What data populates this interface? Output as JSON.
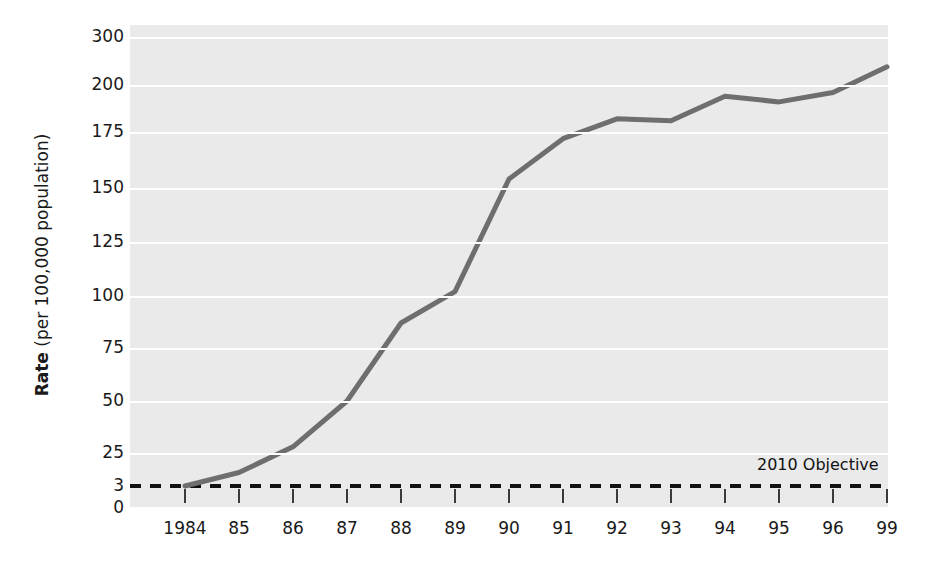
{
  "chart_data": {
    "type": "line",
    "title": "",
    "xlabel": "",
    "ylabel": "Rate (per 100,000 population)",
    "ylabel_bold_part": "Rate",
    "ylabel_rest": " (per 100,000 population)",
    "categories": [
      "1984",
      "85",
      "86",
      "87",
      "88",
      "89",
      "90",
      "91",
      "92",
      "93",
      "94",
      "95",
      "96",
      "99"
    ],
    "values": [
      3,
      12,
      28,
      50,
      87,
      102,
      154,
      172,
      182,
      181,
      194,
      191,
      196,
      238
    ],
    "series": [
      {
        "name": "Rate",
        "color": "#6e6e6e",
        "values": [
          3,
          12,
          28,
          50,
          87,
          102,
          154,
          172,
          182,
          181,
          194,
          191,
          196,
          238
        ]
      }
    ],
    "ytick_labels": [
      "0",
      "3",
      "25",
      "50",
      "75",
      "100",
      "125",
      "150",
      "175",
      "200",
      "300"
    ],
    "ytick_values": [
      0,
      3,
      25,
      50,
      75,
      100,
      125,
      150,
      175,
      200,
      300
    ],
    "yaxis_scale": "categorical-uneven",
    "ylim": [
      0,
      300
    ],
    "grid": true,
    "legend": "none",
    "annotations": [
      {
        "name": "objective-line",
        "label": "2010 Objective",
        "value": 3,
        "style": "dashed",
        "color": "#111111"
      }
    ],
    "plot_background": "#eaeaea",
    "gridline_color": "#ffffff"
  },
  "axis": {
    "y_label_bold": "Rate",
    "y_label_rest": " (per 100,000 population)"
  },
  "ticks": {
    "y": [
      {
        "label": "300",
        "y": 37
      },
      {
        "label": "200",
        "y": 85
      },
      {
        "label": "175",
        "y": 132
      },
      {
        "label": "150",
        "y": 188
      },
      {
        "label": "125",
        "y": 242
      },
      {
        "label": "100",
        "y": 296
      },
      {
        "label": "75",
        "y": 348
      },
      {
        "label": "50",
        "y": 401
      },
      {
        "label": "25",
        "y": 453
      },
      {
        "label": "3",
        "y": 486
      },
      {
        "label": "0",
        "y": 508
      }
    ],
    "x": [
      {
        "label": "1984",
        "x": 185
      },
      {
        "label": "85",
        "x": 239
      },
      {
        "label": "86",
        "x": 293
      },
      {
        "label": "87",
        "x": 347
      },
      {
        "label": "88",
        "x": 401
      },
      {
        "label": "89",
        "x": 455
      },
      {
        "label": "90",
        "x": 509
      },
      {
        "label": "91",
        "x": 563
      },
      {
        "label": "92",
        "x": 617
      },
      {
        "label": "93",
        "x": 671
      },
      {
        "label": "94",
        "x": 725
      },
      {
        "label": "95",
        "x": 779
      },
      {
        "label": "96",
        "x": 833
      },
      {
        "label": "99",
        "x": 887
      }
    ]
  },
  "objective": {
    "label": "2010 Objective"
  }
}
